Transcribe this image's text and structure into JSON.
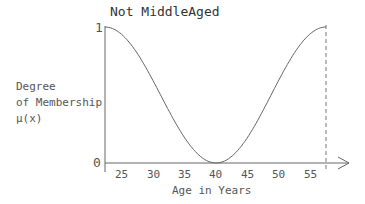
{
  "chart_data": {
    "type": "line",
    "title": "Not MiddleAged",
    "xlabel": "Age in Years",
    "ylabel": [
      "Degree",
      "of Membership",
      "μ(x)"
    ],
    "x_ticks": [
      "25",
      "30",
      "35",
      "40",
      "45",
      "50",
      "55"
    ],
    "y_ticks": [
      "0",
      "1"
    ],
    "xlim": [
      22.3,
      57.5
    ],
    "ylim": [
      0,
      1
    ],
    "series": [
      {
        "name": "Not MiddleAged",
        "x": [
          22.3,
          25,
          30,
          35,
          40,
          45,
          50,
          55,
          57.5
        ],
        "values": [
          1.0,
          0.95,
          0.65,
          0.2,
          0.0,
          0.2,
          0.65,
          0.95,
          1.0
        ]
      }
    ],
    "annotations": [
      "dashed vertical line at right end of domain (~57.5)"
    ],
    "grid": false,
    "legend": "none"
  },
  "colors": {
    "curve": "#666666",
    "axis": "#555555"
  }
}
